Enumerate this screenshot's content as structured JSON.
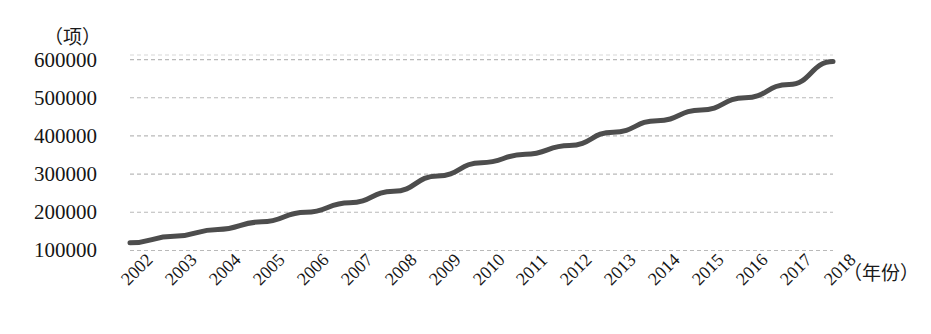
{
  "chart_data": {
    "type": "line",
    "title": "",
    "xlabel": "（年份）",
    "ylabel": "（项）",
    "categories": [
      "2002",
      "2003",
      "2004",
      "2005",
      "2006",
      "2007",
      "2008",
      "2009",
      "2010",
      "2011",
      "2012",
      "2013",
      "2014",
      "2015",
      "2016",
      "2017",
      "2018"
    ],
    "values": [
      120000,
      137000,
      155000,
      175000,
      200000,
      225000,
      255000,
      295000,
      330000,
      352000,
      375000,
      410000,
      440000,
      468000,
      500000,
      535000,
      595000
    ],
    "ytick_labels": [
      "600000",
      "500000",
      "400000",
      "300000",
      "200000",
      "100000"
    ],
    "ytick_values": [
      600000,
      500000,
      400000,
      300000,
      200000,
      100000
    ],
    "ylim": [
      62000,
      612000
    ],
    "xlim": [
      "2002",
      "2018"
    ],
    "grid": true,
    "grid_style": "dashed-horizontal",
    "legend": "none",
    "series_color": "#4d4d4d",
    "grid_color": "#b9b9b9"
  }
}
